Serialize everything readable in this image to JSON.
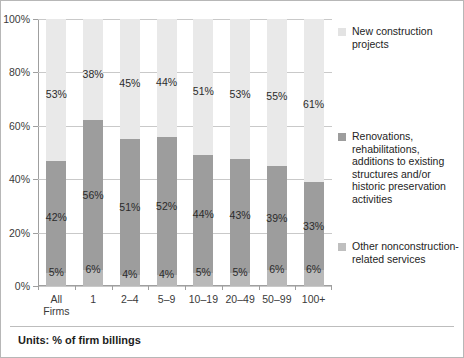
{
  "chart_data": {
    "type": "bar",
    "subtype": "stacked-bar-100",
    "title": "",
    "xlabel": "",
    "ylabel": "",
    "ylim": [
      0,
      100
    ],
    "ytick_labels": [
      "0%",
      "20%",
      "40%",
      "60%",
      "80%",
      "100%"
    ],
    "ytick_values": [
      0,
      20,
      40,
      60,
      80,
      100
    ],
    "grid": true,
    "legend_position": "right",
    "units_note": "Units: % of firm billings",
    "categories": [
      "All Firms",
      "1",
      "2–4",
      "5–9",
      "10–19",
      "20–49",
      "50–99",
      "100+"
    ],
    "category_labels_line1": [
      "All",
      "1",
      "2–4",
      "5–9",
      "10–19",
      "20–49",
      "50–99",
      "100+"
    ],
    "category_labels_line2": [
      "Firms",
      "",
      "",
      "",
      "",
      "",
      "",
      ""
    ],
    "series": [
      {
        "name": "Other nonconstruction-related services",
        "color": "#b9b9b9",
        "stack_order": 0,
        "values": [
          5,
          6,
          4,
          4,
          5,
          5,
          6,
          6
        ],
        "labels": [
          "5%",
          "6%",
          "4%",
          "4%",
          "5%",
          "5%",
          "6%",
          "6%"
        ]
      },
      {
        "name": "Renovations, rehabilitations, additions to existing structures and/or historic preservation activities",
        "color": "#9d9d9d",
        "stack_order": 1,
        "values": [
          42,
          56,
          51,
          52,
          44,
          43,
          39,
          33
        ],
        "labels": [
          "42%",
          "56%",
          "51%",
          "52%",
          "44%",
          "43%",
          "39%",
          "33%"
        ]
      },
      {
        "name": "New construction projects",
        "color": "#e9e9e9",
        "stack_order": 2,
        "values": [
          53,
          38,
          45,
          44,
          51,
          53,
          55,
          61
        ],
        "labels": [
          "53%",
          "38%",
          "45%",
          "44%",
          "51%",
          "53%",
          "55%",
          "61%"
        ]
      }
    ]
  },
  "legend": {
    "items": [
      {
        "label": "New construction projects",
        "swatch_class": "sw-new"
      },
      {
        "label": "Renovations, rehabilitations, additions to existing structures and/or historic preservation activities",
        "swatch_class": "sw-ren"
      },
      {
        "label": "Other nonconstruction-related services",
        "swatch_class": "sw-oth"
      }
    ]
  },
  "footer": {
    "units_text": "Units: % of firm billings"
  }
}
